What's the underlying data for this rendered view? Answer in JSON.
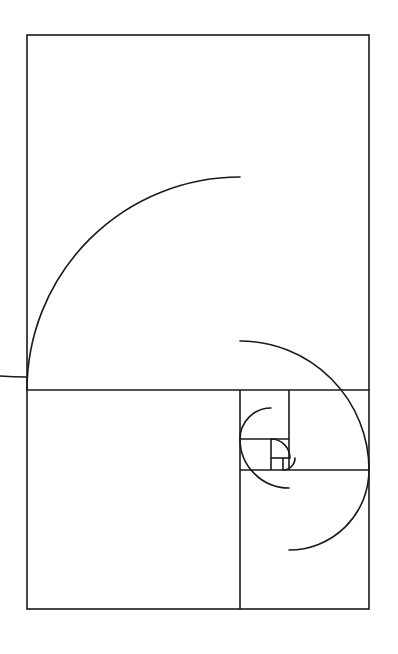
{
  "figure": {
    "canvas": {
      "width": 398,
      "height": 654
    },
    "background_color": "#ffffff",
    "stroke_color": "#1a1a1a",
    "stroke_width": 1.6,
    "outer_rect": {
      "x": 27,
      "y": 35,
      "width": 342,
      "height": 574
    }
  },
  "chart_data": {
    "type": "diagram",
    "ratio": 1.618,
    "sequence": [
      1,
      1,
      2,
      3,
      5,
      8,
      13,
      21
    ],
    "squares": [
      {
        "index": 1,
        "fib": 21,
        "x": 27,
        "y": 35,
        "size": 342,
        "corner": "bottom-left",
        "label": "square-21"
      },
      {
        "index": 2,
        "fib": 13,
        "x": 27,
        "y": 390,
        "size": 213,
        "corner": "top-right",
        "label": "square-13"
      },
      {
        "index": 3,
        "fib": 8,
        "x": 240,
        "y": 470,
        "size": 129,
        "corner": "top-left",
        "label": "square-8"
      },
      {
        "index": 4,
        "fib": 5,
        "x": 289,
        "y": 390,
        "size": 80,
        "corner": "bottom-left",
        "label": "square-5"
      },
      {
        "index": 5,
        "fib": 3,
        "x": 240,
        "y": 390,
        "size": 49,
        "corner": "bottom-right",
        "label": "square-3"
      },
      {
        "index": 6,
        "fib": 2,
        "x": 240,
        "y": 439,
        "size": 31,
        "corner": "top-right",
        "label": "square-2"
      },
      {
        "index": 7,
        "fib": 1,
        "x": 271,
        "y": 439,
        "size": 19,
        "corner": "top-left",
        "label": "square-1a"
      },
      {
        "index": 8,
        "fib": 1,
        "x": 271,
        "y": 458,
        "size": 12,
        "corner": "bottom-left",
        "label": "square-1b"
      }
    ],
    "divider_lines": [
      {
        "name": "divider-horizontal-main",
        "x1": 27,
        "y1": 390,
        "x2": 369,
        "y2": 390
      },
      {
        "name": "divider-vertical-lower",
        "x1": 240,
        "y1": 390,
        "x2": 240,
        "y2": 609
      },
      {
        "name": "divider-horizontal-8",
        "x1": 240,
        "y1": 470,
        "x2": 369,
        "y2": 470
      },
      {
        "name": "divider-vertical-5",
        "x1": 289,
        "y1": 390,
        "x2": 289,
        "y2": 470
      },
      {
        "name": "divider-horizontal-3",
        "x1": 240,
        "y1": 439,
        "x2": 289,
        "y2": 439
      },
      {
        "name": "divider-vertical-2",
        "x1": 271,
        "y1": 439,
        "x2": 271,
        "y2": 470
      },
      {
        "name": "divider-horizontal-1",
        "x1": 271,
        "y1": 458,
        "x2": 290,
        "y2": 458
      },
      {
        "name": "divider-vertical-1b",
        "x1": 283,
        "y1": 458,
        "x2": 283,
        "y2": 470
      }
    ],
    "arcs": [
      {
        "name": "arc-21",
        "cx": 27,
        "cy": 35,
        "r": 342,
        "start_angle": 90,
        "end_angle": 180
      },
      {
        "name": "arc-13",
        "cx": 240,
        "cy": 390,
        "r": 213,
        "start_angle": 180,
        "end_angle": 270
      },
      {
        "name": "arc-8",
        "cx": 240,
        "cy": 470,
        "r": 129,
        "start_angle": 270,
        "end_angle": 360
      },
      {
        "name": "arc-5",
        "cx": 289,
        "cy": 470,
        "r": 80,
        "start_angle": 0,
        "end_angle": 90
      },
      {
        "name": "arc-3",
        "cx": 289,
        "cy": 439,
        "r": 49,
        "start_angle": 90,
        "end_angle": 180
      },
      {
        "name": "arc-2",
        "cx": 271,
        "cy": 439,
        "r": 31,
        "start_angle": 180,
        "end_angle": 270
      },
      {
        "name": "arc-1a",
        "cx": 271,
        "cy": 458,
        "r": 19,
        "start_angle": 270,
        "end_angle": 360
      },
      {
        "name": "arc-1b",
        "cx": 283,
        "cy": 458,
        "r": 12,
        "start_angle": 0,
        "end_angle": 90
      }
    ],
    "xlabel": "",
    "ylabel": "",
    "grid": false,
    "legend": false
  }
}
